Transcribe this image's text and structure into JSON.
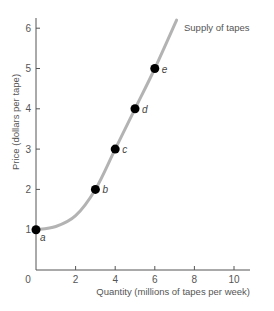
{
  "chart_data": {
    "type": "line",
    "title": "",
    "xlabel": "Quantity (millions of tapes per week)",
    "ylabel": "Price (dollars per tape)",
    "xlim": [
      0,
      10
    ],
    "ylim": [
      0,
      6
    ],
    "x_ticks": [
      "0",
      "2",
      "4",
      "6",
      "8",
      "10"
    ],
    "y_ticks": [
      "1",
      "2",
      "3",
      "4",
      "5",
      "6"
    ],
    "grid": false,
    "series": [
      {
        "name": "Supply of tapes",
        "color": "#b3b3b3",
        "curve": [
          [
            0,
            1
          ],
          [
            1,
            1.08
          ],
          [
            2,
            1.35
          ],
          [
            3,
            2
          ],
          [
            4,
            3
          ],
          [
            5,
            4
          ],
          [
            6,
            5
          ],
          [
            7.1,
            6.2
          ]
        ],
        "points": [
          {
            "label": "a",
            "x": 0,
            "y": 1
          },
          {
            "label": "b",
            "x": 3,
            "y": 2
          },
          {
            "label": "c",
            "x": 4,
            "y": 3
          },
          {
            "label": "d",
            "x": 5,
            "y": 4
          },
          {
            "label": "e",
            "x": 6,
            "y": 5
          }
        ]
      }
    ],
    "annotations": [
      {
        "text": "Supply of tapes",
        "x": 7.5,
        "y": 6.1
      }
    ]
  }
}
